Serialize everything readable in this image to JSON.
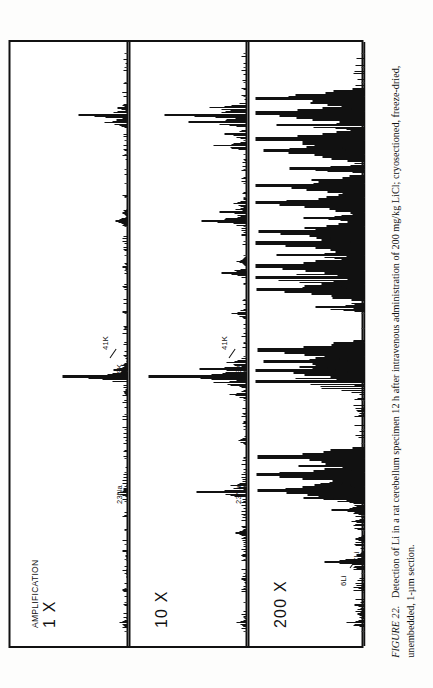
{
  "figure": {
    "number_label": "FIGURE 22.",
    "caption_text": "Detection of Li in a rat cerebellum specimen 12 h after intravenous administration of 200 mg/kg LiCl; cryosectioned, freeze-dried, unembedded, 1-µm section."
  },
  "panels": [
    {
      "id": "panel-1x",
      "amplification_title": "AMPLIFICATION",
      "amplification_value": "1 X",
      "ion_labels": [
        {
          "name": "sodium-23",
          "text": "23Na"
        },
        {
          "name": "potassium-39",
          "text": "39K"
        },
        {
          "name": "potassium-41",
          "text": "41K"
        }
      ]
    },
    {
      "id": "panel-10x",
      "amplification_title": "",
      "amplification_value": "10 X",
      "ion_labels": [
        {
          "name": "sodium-23",
          "text": "23Na"
        },
        {
          "name": "potassium-39",
          "text": "39K"
        },
        {
          "name": "potassium-41",
          "text": "41K"
        }
      ]
    },
    {
      "id": "panel-200x",
      "amplification_title": "",
      "amplification_value": "200 X",
      "ion_labels": [
        {
          "name": "lithium-6",
          "text": "6Li"
        },
        {
          "name": "lithium-7",
          "text": "7Li"
        },
        {
          "name": "sodium-23",
          "text": "23Na"
        },
        {
          "name": "potassium-39-41",
          "text": "39K 41K"
        }
      ]
    }
  ],
  "chart_data": {
    "type": "line",
    "title": "Detection of Li in a rat cerebellum specimen",
    "xlabel": "mass (m/z), increasing left to right",
    "ylabel": "secondary ion intensity (arbitrary units)",
    "ylim": [
      0,
      100
    ],
    "grid": false,
    "legend_position": "none",
    "annotations": [
      "6Li",
      "7Li",
      "23Na",
      "39K",
      "41K"
    ],
    "series": [
      {
        "name": "AMPLIFICATION 1 X",
        "panel": "panel-1x",
        "points": [
          {
            "x": 1.5,
            "y": 7.0,
            "label": ""
          },
          {
            "x": 10.0,
            "y": 2.0,
            "label": ""
          },
          {
            "x": 13.0,
            "y": 1.5,
            "label": ""
          },
          {
            "x": 24.0,
            "y": 9.0,
            "label": "23Na"
          },
          {
            "x": 24.6,
            "y": 3.0,
            "label": ""
          },
          {
            "x": 41.5,
            "y": 3.5,
            "label": ""
          },
          {
            "x": 44.0,
            "y": 58.0,
            "label": "39K"
          },
          {
            "x": 45.2,
            "y": 12.0,
            "label": "41K"
          },
          {
            "x": 46.0,
            "y": 5.0,
            "label": ""
          },
          {
            "x": 63.0,
            "y": 4.0,
            "label": ""
          },
          {
            "x": 71.0,
            "y": 11.0,
            "label": ""
          },
          {
            "x": 72.4,
            "y": 4.0,
            "label": ""
          },
          {
            "x": 88.0,
            "y": 20.0,
            "label": ""
          },
          {
            "x": 89.3,
            "y": 44.0,
            "label": ""
          },
          {
            "x": 90.5,
            "y": 9.0,
            "label": ""
          }
        ]
      },
      {
        "name": "10 X",
        "panel": "panel-10x",
        "points": [
          {
            "x": 1.5,
            "y": 9.0,
            "label": ""
          },
          {
            "x": 9.0,
            "y": 4.0,
            "label": ""
          },
          {
            "x": 17.0,
            "y": 10.0,
            "label": ""
          },
          {
            "x": 24.0,
            "y": 45.0,
            "label": "23Na"
          },
          {
            "x": 25.2,
            "y": 14.0,
            "label": ""
          },
          {
            "x": 33.0,
            "y": 7.0,
            "label": ""
          },
          {
            "x": 41.0,
            "y": 15.0,
            "label": ""
          },
          {
            "x": 43.0,
            "y": 30.0,
            "label": ""
          },
          {
            "x": 44.0,
            "y": 88.0,
            "label": "39K"
          },
          {
            "x": 45.3,
            "y": 42.0,
            "label": "41K"
          },
          {
            "x": 46.5,
            "y": 18.0,
            "label": ""
          },
          {
            "x": 55.0,
            "y": 13.0,
            "label": ""
          },
          {
            "x": 62.0,
            "y": 22.0,
            "label": ""
          },
          {
            "x": 64.0,
            "y": 9.0,
            "label": ""
          },
          {
            "x": 71.0,
            "y": 40.0,
            "label": ""
          },
          {
            "x": 72.5,
            "y": 24.0,
            "label": ""
          },
          {
            "x": 74.0,
            "y": 12.0,
            "label": ""
          },
          {
            "x": 84.0,
            "y": 30.0,
            "label": ""
          },
          {
            "x": 86.0,
            "y": 20.0,
            "label": ""
          },
          {
            "x": 88.0,
            "y": 52.0,
            "label": ""
          },
          {
            "x": 89.3,
            "y": 74.0,
            "label": ""
          },
          {
            "x": 90.6,
            "y": 33.0,
            "label": ""
          }
        ]
      },
      {
        "name": "200 X",
        "panel": "panel-200x",
        "points": [
          {
            "x": 1.5,
            "y": 16.0,
            "label": ""
          },
          {
            "x": 3.0,
            "y": 6.0,
            "label": ""
          },
          {
            "x": 4.5,
            "y": 9.0,
            "label": ""
          },
          {
            "x": 7.5,
            "y": 5.0,
            "label": ""
          },
          {
            "x": 12.0,
            "y": 36.0,
            "label": "6Li"
          },
          {
            "x": 13.2,
            "y": 7.0,
            "label": "7Li"
          },
          {
            "x": 16.0,
            "y": 8.0,
            "label": ""
          },
          {
            "x": 19.0,
            "y": 12.0,
            "label": ""
          },
          {
            "x": 21.0,
            "y": 30.0,
            "label": ""
          },
          {
            "x": 23.0,
            "y": 55.0,
            "label": ""
          },
          {
            "x": 24.2,
            "y": 97.0,
            "label": "23Na"
          },
          {
            "x": 25.6,
            "y": 40.0,
            "label": ""
          },
          {
            "x": 27.0,
            "y": 98.0,
            "label": ""
          },
          {
            "x": 28.5,
            "y": 60.0,
            "label": ""
          },
          {
            "x": 30.0,
            "y": 97.0,
            "label": ""
          },
          {
            "x": 38.0,
            "y": 6.0,
            "label": ""
          },
          {
            "x": 43.0,
            "y": 99.0,
            "label": "39K"
          },
          {
            "x": 45.0,
            "y": 99.0,
            "label": "41K"
          },
          {
            "x": 46.5,
            "y": 92.0,
            "label": ""
          },
          {
            "x": 48.5,
            "y": 97.0,
            "label": ""
          },
          {
            "x": 56.0,
            "y": 44.0,
            "label": ""
          },
          {
            "x": 59.0,
            "y": 98.0,
            "label": ""
          },
          {
            "x": 61.0,
            "y": 99.0,
            "label": ""
          },
          {
            "x": 63.0,
            "y": 99.0,
            "label": ""
          },
          {
            "x": 65.0,
            "y": 80.0,
            "label": ""
          },
          {
            "x": 67.0,
            "y": 99.0,
            "label": ""
          },
          {
            "x": 69.0,
            "y": 96.0,
            "label": ""
          },
          {
            "x": 71.5,
            "y": 55.0,
            "label": ""
          },
          {
            "x": 74.0,
            "y": 99.0,
            "label": ""
          },
          {
            "x": 77.0,
            "y": 99.0,
            "label": ""
          },
          {
            "x": 80.0,
            "y": 68.0,
            "label": ""
          },
          {
            "x": 83.0,
            "y": 92.0,
            "label": ""
          },
          {
            "x": 85.0,
            "y": 99.0,
            "label": ""
          },
          {
            "x": 87.5,
            "y": 80.0,
            "label": ""
          },
          {
            "x": 89.5,
            "y": 99.0,
            "label": ""
          },
          {
            "x": 92.0,
            "y": 99.0,
            "label": ""
          }
        ]
      }
    ]
  }
}
